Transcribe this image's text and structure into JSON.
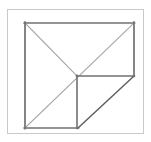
{
  "figure": {
    "canvas": {
      "width": 151,
      "height": 142
    },
    "background_color": "#ffffff",
    "outer_frame": {
      "name": "outer-frame",
      "x": 7.5,
      "y": 9.5,
      "width": 136,
      "height": 124,
      "stroke_color": "#c9c9c9",
      "stroke_width": 1
    },
    "geometry": {
      "square_left": 25,
      "square_top": 23,
      "square_right": 134,
      "square_bottom": 128,
      "center_x": 77,
      "center_y": 76
    },
    "strokes": {
      "edge_color": "#6e6e6e",
      "edge_width": 1.6,
      "diagonal_color": "#9e9e9e",
      "diagonal_width": 1.1,
      "cut_color": "#5a5a5a",
      "cut_width": 1.4
    },
    "segments": [
      {
        "name": "square-top-edge",
        "points": "25,23 134,23"
      },
      {
        "name": "square-left-edge",
        "points": "25,23 25,128"
      },
      {
        "name": "square-bottom-edge-partial",
        "points": "25,128 78,128"
      },
      {
        "name": "square-right-edge-partial",
        "points": "134,23 134,76"
      },
      {
        "name": "cut-diagonal-hypotenuse",
        "points": "134,76 78,128"
      },
      {
        "name": "main-diagonal-bottomleft-to-topright",
        "points": "25,128 134,23"
      },
      {
        "name": "anti-diagonal-topleft-to-center",
        "points": "25,23 77,76"
      },
      {
        "name": "center-horizontal-to-right",
        "points": "77,76 134,76"
      },
      {
        "name": "center-vertical-to-bottom",
        "points": "77,76 77,128"
      }
    ]
  }
}
